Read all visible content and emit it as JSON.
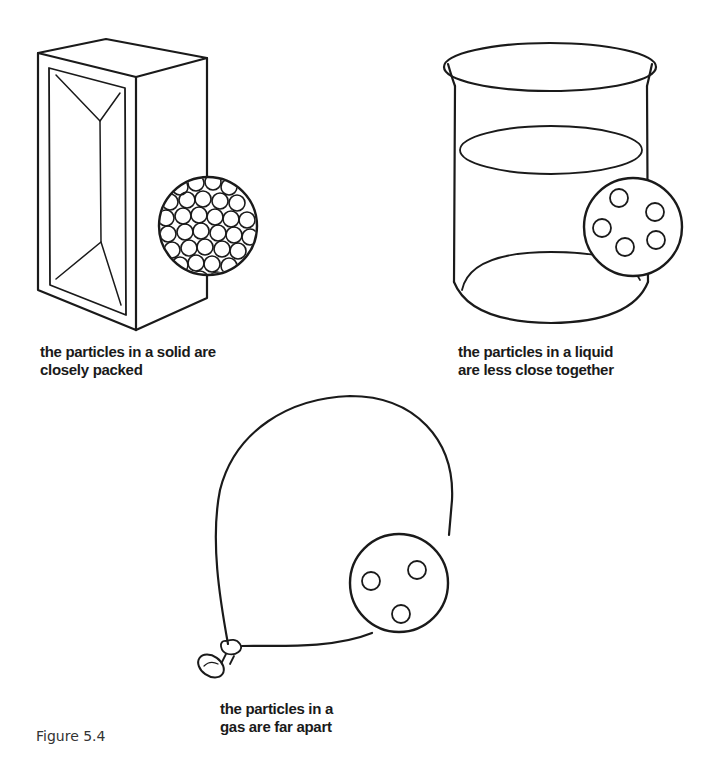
{
  "figure": {
    "label": "Figure 5.4",
    "line_color": "#1a1a1a",
    "background": "#ffffff"
  },
  "panels": [
    {
      "state": "solid",
      "object": "rectangular block",
      "caption_lines": [
        "the particles in a solid are",
        "closely packed"
      ],
      "particle_view": "many closely packed circles"
    },
    {
      "state": "liquid",
      "object": "beaker of liquid",
      "caption_lines": [
        "the particles in a liquid",
        "are less close together"
      ],
      "particle_count": 5
    },
    {
      "state": "gas",
      "object": "balloon",
      "caption_lines": [
        "the particles in a",
        "gas are far apart"
      ],
      "particle_count": 3
    }
  ]
}
